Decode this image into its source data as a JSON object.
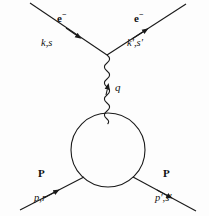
{
  "figure": {
    "kind": "feynman-diagram",
    "width": 209,
    "height": 216,
    "background_color": "#fdfdfd",
    "line_color": "#1a1a1a"
  },
  "labels": {
    "electron_incoming": "e",
    "electron_incoming_charge": "−",
    "electron_incoming_momentum": "k,s",
    "electron_outgoing": "e",
    "electron_outgoing_charge": "−",
    "electron_outgoing_momentum": "k′,s′",
    "photon_momentum": "q",
    "proton_incoming": "P",
    "proton_incoming_momentum": "p,r",
    "proton_outgoing": "P",
    "proton_outgoing_momentum": "p′,s′"
  },
  "geometry": {
    "vertex": {
      "x": 107,
      "y": 55
    },
    "blob": {
      "cx": 108,
      "cy": 150,
      "r": 37
    },
    "photon": {
      "x": 107,
      "y_top": 55,
      "y_bottom": 115,
      "amplitude": 4.2,
      "wavelength": 9
    },
    "electron_in_line": {
      "x1": 30,
      "y1": 3,
      "x2": 107,
      "y2": 55
    },
    "electron_out_line": {
      "x1": 107,
      "y1": 55,
      "x2": 186,
      "y2": 4
    },
    "proton_in_line": {
      "x1": 20,
      "y1": 210,
      "x2": 84,
      "y2": 177
    },
    "proton_out_line": {
      "x1": 133,
      "y1": 177,
      "x2": 196,
      "y2": 211
    }
  }
}
